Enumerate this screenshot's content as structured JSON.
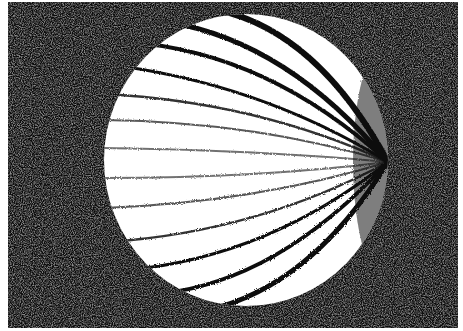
{
  "image": {
    "description": "Grainy black-and-white photograph of a white sphere with dark meridian stripes converging toward the right side, on a speckled dark background",
    "background_color": "#0a0a0a",
    "sphere_color": "#ffffff",
    "stripe_color": "#111111",
    "border_color": "#ffffff"
  }
}
